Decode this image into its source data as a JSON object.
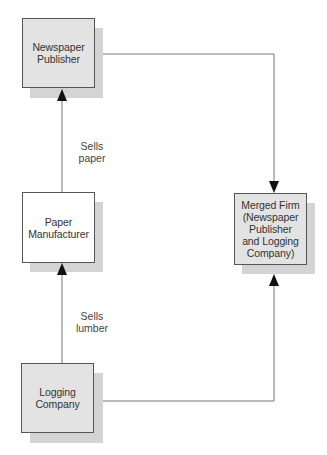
{
  "diagram": {
    "type": "vertical integration vs merger flow",
    "nodes": [
      {
        "id": "newspaper",
        "label": "Newspaper\nPublisher",
        "fill": "#e3e3e3"
      },
      {
        "id": "paper",
        "label": "Paper\nManufacturer",
        "fill": "#ffffff"
      },
      {
        "id": "logging",
        "label": "Logging\nCompany",
        "fill": "#e3e3e3"
      },
      {
        "id": "merged",
        "label": "Merged Firm\n(Newspaper\nPublisher\nand Logging\nCompany)",
        "fill": "#e3e3e3"
      }
    ],
    "edges": [
      {
        "from": "paper",
        "to": "newspaper",
        "label": "Sells\npaper"
      },
      {
        "from": "logging",
        "to": "paper",
        "label": "Sells\nlumber"
      },
      {
        "from": "newspaper",
        "to": "merged",
        "label": ""
      },
      {
        "from": "logging",
        "to": "merged",
        "label": ""
      }
    ],
    "colors": {
      "box_border": "#555555",
      "shadow": "#d4d4d4",
      "line": "#777777",
      "arrow": "#111111",
      "text": "#333333"
    }
  }
}
